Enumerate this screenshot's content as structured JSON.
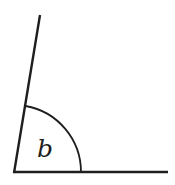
{
  "diagram": {
    "type": "angle",
    "angle_label": "b",
    "vertex": [
      14,
      172
    ],
    "rays": [
      {
        "name": "slanted-ray",
        "from": [
          14,
          172
        ],
        "to": [
          40,
          15
        ]
      },
      {
        "name": "horizontal-ray",
        "from": [
          14,
          172
        ],
        "to": [
          168,
          172
        ]
      }
    ],
    "arc": {
      "radius": 67,
      "start": [
        81,
        172
      ],
      "end": [
        26,
        106
      ]
    },
    "colors": {
      "stroke": "#1e1e1e",
      "background": "#ffffff"
    }
  }
}
